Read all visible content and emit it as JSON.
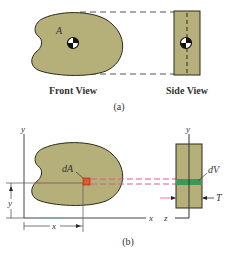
{
  "figure_a": {
    "area_label": "A",
    "front_view_label": "Front View",
    "side_view_label": "Side View",
    "caption": "(a)"
  },
  "figure_b": {
    "area_element_label": "dA",
    "volume_element_label": "dV",
    "thickness_label": "T",
    "x_axis_label": "x",
    "y_axis_label": "y",
    "z_axis_label": "z",
    "side_y_axis_label": "y",
    "x_dimension_label": "x",
    "y_dimension_label": "y",
    "caption": "(b)"
  },
  "colors": {
    "shape_fill": "#b5b07a",
    "shape_stroke": "#2a2a1a",
    "element_fill": "#e8552a",
    "strip_fill": "#3a9a5a",
    "projection_dash": "#e05a8a",
    "guide_dash": "#555555",
    "axis": "#444444"
  }
}
